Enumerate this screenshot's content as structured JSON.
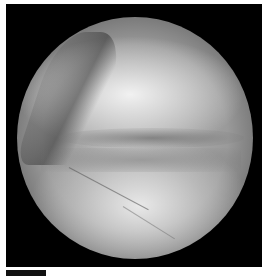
{
  "image": {
    "description": "Circular arthroscopic view of a joint surface in grayscale on a black square background",
    "colors": {
      "background": "#ffffff",
      "frame": "#000000",
      "tissue_light": "#f0f0f0",
      "tissue_mid": "#9a9a9a",
      "scale_bar": "#111111"
    }
  },
  "scale_bar": {
    "label": ""
  }
}
